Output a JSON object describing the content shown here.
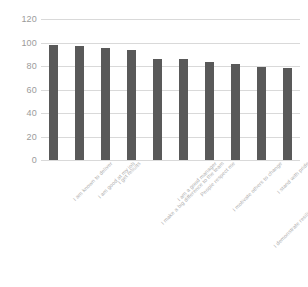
{
  "chart_data": {
    "type": "bar",
    "title": "",
    "subtitle": "",
    "xlabel": "",
    "ylabel": "",
    "ylim": [
      0,
      120
    ],
    "ytick_step": 20,
    "yticks": [
      "120",
      "100",
      "80",
      "60",
      "40",
      "20",
      "0"
    ],
    "grid": true,
    "legend": false,
    "legend_position": "none",
    "bar_color": "#595959",
    "gridline_color": "#d9d9d9",
    "tick_label_color": "#9b9b9b",
    "category_label_color": "#b0b0b0",
    "category_label_rotation": -45,
    "categories": [
      "I am known to deliver",
      "I am good at my job",
      "I get results",
      "I make a big difference to the team",
      "I am a good manager",
      "People respect me",
      "I motivate others to change",
      "I demonstrate resilience in the face of challenge",
      "I stand with pride",
      "I make a difference to the organisation"
    ],
    "values": [
      98,
      97,
      95,
      94,
      86,
      86,
      83,
      82,
      79,
      78
    ]
  }
}
